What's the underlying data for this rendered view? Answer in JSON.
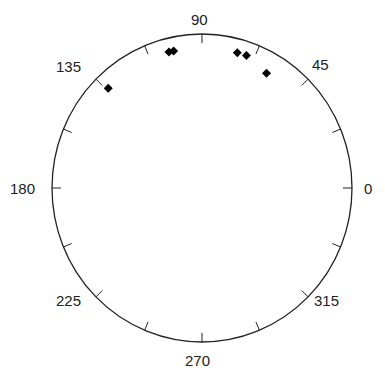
{
  "chart_data": {
    "type": "scatter",
    "title": "",
    "coordinate_system": "polar",
    "angle_unit": "degrees",
    "angle_tick_labels": [
      "0",
      "45",
      "90",
      "135",
      "180",
      "225",
      "270",
      "315"
    ],
    "minor_ticks_every_deg": 22.5,
    "points": [
      {
        "angle": 60,
        "r": 0.86
      },
      {
        "angle": 71,
        "r": 0.91
      },
      {
        "angle": 75,
        "r": 0.91
      },
      {
        "angle": 102,
        "r": 0.91
      },
      {
        "angle": 104,
        "r": 0.91
      },
      {
        "angle": 134,
        "r": 0.9
      }
    ],
    "marker": "diamond",
    "marker_color": "#000000",
    "grid": false,
    "legend": null
  },
  "labels": {
    "a0": "0",
    "a45": "45",
    "a90": "90",
    "a135": "135",
    "a180": "180",
    "a225": "225",
    "a270": "270",
    "a315": "315"
  }
}
